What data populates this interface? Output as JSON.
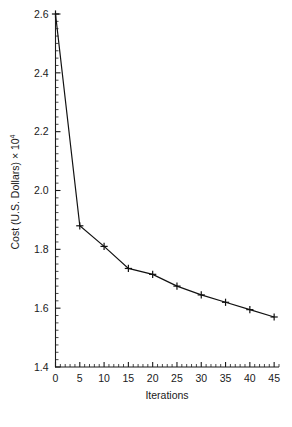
{
  "chart_data": {
    "type": "line",
    "title": "",
    "xlabel": "Iterations",
    "ylabel": "Cost (U.S. Dollars) × 10",
    "ylabel_exponent": "4",
    "ylabel_full": "Cost (U.S. Dollars) × 10⁴",
    "x": [
      0,
      5,
      10,
      15,
      20,
      25,
      30,
      35,
      40,
      45
    ],
    "values": [
      2.6,
      1.88,
      1.81,
      1.735,
      1.715,
      1.675,
      1.645,
      1.62,
      1.595,
      1.57
    ],
    "series": [
      {
        "name": "Cost",
        "values": [
          2.6,
          1.88,
          1.81,
          1.735,
          1.715,
          1.675,
          1.645,
          1.62,
          1.595,
          1.57
        ]
      }
    ],
    "xlim": [
      0,
      46
    ],
    "ylim": [
      1.4,
      2.6
    ],
    "xticks": [
      0,
      5,
      10,
      15,
      20,
      25,
      30,
      35,
      40,
      45
    ],
    "xtick_labels": [
      "0",
      "5",
      "10",
      "15",
      "20",
      "25",
      "30",
      "35",
      "40",
      "45"
    ],
    "yticks": [
      1.4,
      1.6,
      1.8,
      2.0,
      2.2,
      2.4,
      2.6
    ],
    "ytick_labels": [
      "1.4",
      "1.6",
      "1.8",
      "2.0",
      "2.2",
      "2.4",
      "2.6"
    ],
    "x_minor_interval": 1,
    "y_minor_interval": 0.025,
    "grid": false,
    "legend": false,
    "marker": "plus",
    "line_color": "#111111",
    "marker_color": "#111111",
    "background_color": "#ffffff",
    "axis_color": "#1a1a1a"
  }
}
